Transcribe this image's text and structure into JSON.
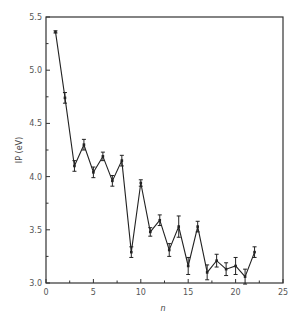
{
  "chart_data": {
    "type": "line",
    "title": "",
    "xlabel": "n",
    "ylabel": "IP (eV)",
    "xlim": [
      0,
      25
    ],
    "ylim": [
      3.0,
      5.5
    ],
    "x_ticks": [
      0,
      5,
      10,
      15,
      20,
      25
    ],
    "x_tick_labels": [
      "0",
      "5",
      "10",
      "15",
      "20",
      "25"
    ],
    "x_minor_ticks": [
      2.5,
      7.5,
      12.5,
      17.5,
      22.5
    ],
    "y_ticks": [
      3.0,
      3.5,
      4.0,
      4.5,
      5.0,
      5.5
    ],
    "y_tick_labels": [
      "3.0",
      "3.5",
      "4.0",
      "4.5",
      "5.0",
      "5.5"
    ],
    "y_minor_ticks": [
      3.25,
      3.75,
      4.25,
      4.75,
      5.25
    ],
    "grid": false,
    "legend": null,
    "series": [
      {
        "name": "IP",
        "x": [
          1,
          2,
          3,
          4,
          5,
          6,
          7,
          8,
          9,
          10,
          11,
          12,
          13,
          14,
          15,
          16,
          17,
          18,
          19,
          20,
          21,
          22
        ],
        "values": [
          5.36,
          4.74,
          4.1,
          4.3,
          4.04,
          4.19,
          3.96,
          4.15,
          3.29,
          3.94,
          3.48,
          3.59,
          3.31,
          3.53,
          3.16,
          3.53,
          3.1,
          3.21,
          3.13,
          3.16,
          3.06,
          3.29
        ],
        "errors": [
          0.01,
          0.05,
          0.05,
          0.05,
          0.05,
          0.04,
          0.05,
          0.05,
          0.05,
          0.03,
          0.04,
          0.05,
          0.06,
          0.1,
          0.08,
          0.05,
          0.07,
          0.06,
          0.06,
          0.08,
          0.07,
          0.05
        ]
      }
    ]
  }
}
